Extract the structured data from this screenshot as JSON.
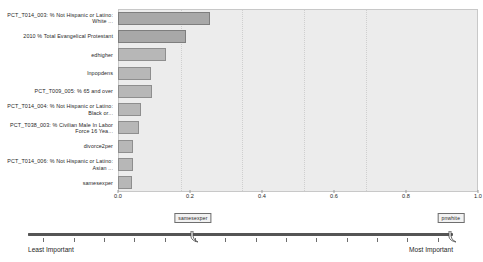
{
  "chart_data": {
    "type": "bar",
    "title": "",
    "xlabel": "",
    "ylabel": "",
    "orientation": "horizontal",
    "xlim": [
      0.0,
      1.0
    ],
    "xticks": [
      "0.0",
      "0.2",
      "0.4",
      "0.6",
      "0.8",
      "1.0"
    ],
    "xtick_values": [
      0.0,
      0.2,
      0.4,
      0.6,
      0.8,
      1.0
    ],
    "grid": true,
    "legend": "none",
    "categories": [
      "PCT_T014_003: % Not Hispanic or Latino: White ...",
      "2010 %  Total Evangelical Protestant",
      "edhigher",
      "lnpopdens",
      "PCT_T009_005: % 65 and over",
      "PCT_T014_004: % Not Hispanic or Latino: Black or...",
      "PCT_T038_003: % Civilian Male In Labor Force 16 Yea...",
      "divorce2per",
      "PCT_T014_006: % Not Hispanic or Latino: Asian ...",
      "samesexper"
    ],
    "values": [
      0.255,
      0.19,
      0.133,
      0.092,
      0.094,
      0.064,
      0.058,
      0.042,
      0.042,
      0.038
    ]
  },
  "slider": {
    "left_label": "Least Important",
    "right_label": "Most Important",
    "handles": [
      {
        "label": "samesexper",
        "position": 0.388
      },
      {
        "label": "pnwhite",
        "position": 0.995
      }
    ],
    "tick_count": 14
  },
  "colors": {
    "bar_fill": "#b7b7b7",
    "bar_fill_dark": "#a8a8a8",
    "bar_stroke": "#8e8e8e",
    "plot_bg": "#ececec",
    "track": "#555555",
    "track_left": "#8c8c8c"
  }
}
